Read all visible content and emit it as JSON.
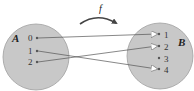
{
  "function_label": "f",
  "set_a": {
    "label": "A",
    "elements": [
      "0",
      "1",
      "2"
    ]
  },
  "set_b": {
    "label": "B",
    "elements": [
      "1",
      "2",
      "3",
      "4"
    ]
  },
  "mappings": [
    {
      "from": "0",
      "to": "1"
    },
    {
      "from": "1",
      "to": "4"
    },
    {
      "from": "2",
      "to": "2"
    }
  ],
  "colors": {
    "set_fill": "#c8c8c8",
    "set_stroke": "#9a9a9a",
    "arrow": "#555555",
    "arrowhead_fill": "#ffffff"
  }
}
